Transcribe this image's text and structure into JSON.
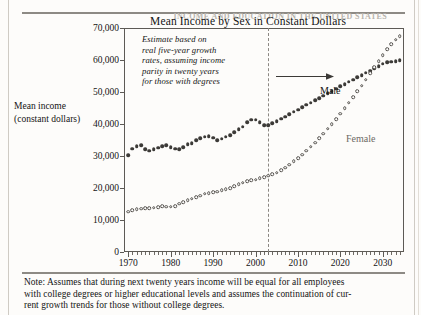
{
  "page": {
    "running_head": "INCOME AND EDUCATION IN THE UNITED STATES"
  },
  "figure": {
    "title": "Mean  Income by Sex in Constant Dollars",
    "y_axis_caption_line1": "Mean  income",
    "y_axis_caption_line2": "(constant dollars)",
    "annotation_lines": [
      "Estimate based on",
      "real five-year growth",
      "rates, assuming income",
      "parity in twenty years",
      "for those with degrees"
    ],
    "series_label_male": "Male",
    "series_label_female": "Female",
    "arrow_icon": "right-arrow-icon",
    "divider_year": 2003,
    "note_lines": [
      "Note: Assumes that during next twenty years income will be equal for all employees",
      "with college degrees or higher educational levels and assumes the continuation of cur-",
      "rent growth trends for those without college degrees."
    ]
  },
  "chart_data": {
    "type": "scatter",
    "title": "Mean  Income by Sex in Constant Dollars",
    "xlabel": "",
    "ylabel": "Mean income (constant dollars)",
    "xlim": [
      1969,
      2035
    ],
    "ylim": [
      0,
      70000
    ],
    "xticks": [
      1970,
      1980,
      1990,
      2000,
      2010,
      2020,
      2030
    ],
    "xtick_labels": [
      "1970",
      "1980",
      "1990",
      "2000",
      "2010",
      "2020",
      "2030"
    ],
    "xtick_minor_step": 1,
    "yticks": [
      0,
      10000,
      20000,
      30000,
      40000,
      50000,
      60000,
      70000
    ],
    "ytick_labels": [
      "0",
      "10,000",
      "20,000",
      "30,000",
      "40,000",
      "50,000",
      "60,000",
      "70,000"
    ],
    "grid": false,
    "legend": "inline-labels",
    "annotations": [
      {
        "text": "Estimate based on real five-year growth rates, assuming income parity in twenty years for those with degrees",
        "x": 1971,
        "y": 63000
      },
      {
        "text": "Male",
        "x": 2009,
        "y": 54500
      },
      {
        "text": "Female",
        "x": 2015,
        "y": 40500
      }
    ],
    "vline": {
      "x": 2003,
      "style": "dashed",
      "label": "projection start"
    },
    "series": [
      {
        "name": "Male",
        "marker": "filled-circle",
        "color": "#3c3a37",
        "x": [
          1970,
          1971,
          1972,
          1973,
          1974,
          1975,
          1976,
          1977,
          1978,
          1979,
          1980,
          1981,
          1982,
          1983,
          1984,
          1985,
          1986,
          1987,
          1988,
          1989,
          1990,
          1991,
          1992,
          1993,
          1994,
          1995,
          1996,
          1997,
          1998,
          1999,
          2000,
          2001,
          2002,
          2003,
          2004,
          2005,
          2006,
          2007,
          2008,
          2009,
          2010,
          2011,
          2012,
          2013,
          2014,
          2015,
          2016,
          2017,
          2018,
          2019,
          2020,
          2021,
          2022,
          2023,
          2024,
          2025,
          2026,
          2027,
          2028,
          2029,
          2030,
          2031,
          2032,
          2033,
          2034
        ],
        "y": [
          30200,
          32300,
          33100,
          33300,
          32200,
          31700,
          32100,
          32600,
          33000,
          33400,
          32800,
          32300,
          32100,
          32700,
          33600,
          34000,
          35000,
          35600,
          36000,
          36200,
          35700,
          35000,
          35400,
          36000,
          36500,
          37400,
          38300,
          39200,
          40500,
          41400,
          41300,
          40500,
          39700,
          39600,
          40200,
          40900,
          41600,
          42300,
          43100,
          43800,
          44500,
          45200,
          46000,
          46700,
          47400,
          48100,
          48900,
          49600,
          50300,
          51000,
          51800,
          52500,
          53200,
          53900,
          54600,
          55300,
          56000,
          56700,
          57400,
          58100,
          58800,
          59300,
          59500,
          59700,
          59900
        ]
      },
      {
        "name": "Female",
        "marker": "open-circle",
        "color": "#54514c",
        "x": [
          1970,
          1971,
          1972,
          1973,
          1974,
          1975,
          1976,
          1977,
          1978,
          1979,
          1980,
          1981,
          1982,
          1983,
          1984,
          1985,
          1986,
          1987,
          1988,
          1989,
          1990,
          1991,
          1992,
          1993,
          1994,
          1995,
          1996,
          1997,
          1998,
          1999,
          2000,
          2001,
          2002,
          2003,
          2004,
          2005,
          2006,
          2007,
          2008,
          2009,
          2010,
          2011,
          2012,
          2013,
          2014,
          2015,
          2016,
          2017,
          2018,
          2019,
          2020,
          2021,
          2022,
          2023,
          2024,
          2025,
          2026,
          2027,
          2028,
          2029,
          2030,
          2031,
          2032,
          2033,
          2034
        ],
        "y": [
          12600,
          13000,
          13300,
          13500,
          13600,
          13700,
          13800,
          14000,
          14300,
          14200,
          14100,
          14400,
          15100,
          15600,
          16100,
          16700,
          17200,
          17600,
          18200,
          18400,
          18600,
          18900,
          19400,
          19600,
          20000,
          20600,
          21100,
          21600,
          22100,
          22400,
          22600,
          23100,
          23400,
          23800,
          24300,
          24800,
          25600,
          26400,
          27300,
          28300,
          29300,
          30400,
          31600,
          32900,
          34200,
          35600,
          37000,
          38500,
          40000,
          41500,
          43200,
          44900,
          46600,
          48400,
          50200,
          52000,
          53900,
          55800,
          57700,
          59600,
          61500,
          63400,
          65000,
          66400,
          67400
        ]
      }
    ]
  }
}
